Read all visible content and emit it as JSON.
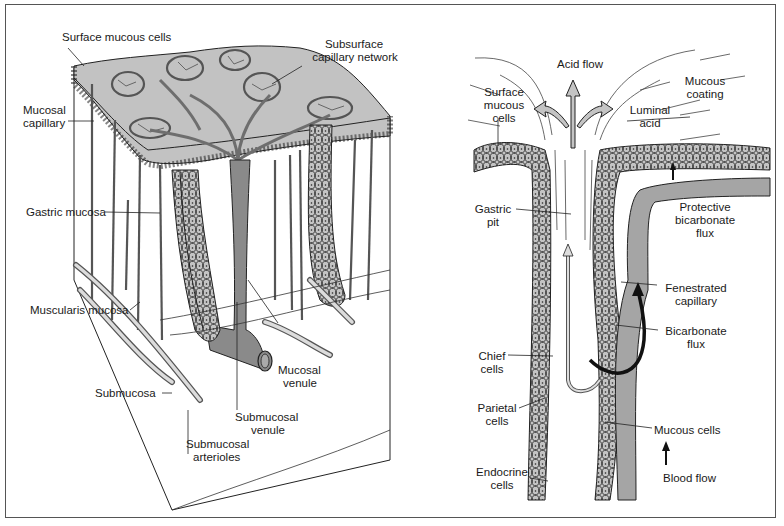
{
  "figure": {
    "panels": [
      {
        "id": "left",
        "description": "3D block of gastric mucosa showing vasculature",
        "labels": {
          "surface_mucous_cells": "Surface mucous cells",
          "subsurface_capillary_network_1": "Subsurface",
          "subsurface_capillary_network_2": "capillary network",
          "mucosal_capillary_1": "Mucosal",
          "mucosal_capillary_2": "capillary",
          "gastric_mucosa": "Gastric mucosa",
          "muscularis_mucosa": "Muscularis mucosa",
          "submucosa": "Submucosa",
          "mucosal_venule_1": "Mucosal",
          "mucosal_venule_2": "venule",
          "submucosal_venule_1": "Submucosal",
          "submucosal_venule_2": "venule",
          "submucosal_arterioles_1": "Submucosal",
          "submucosal_arterioles_2": "arterioles"
        }
      },
      {
        "id": "right",
        "description": "Gastric pit cross-section showing acid and bicarbonate flux",
        "labels": {
          "acid_flow": "Acid flow",
          "surface_mucous_cells_1": "Surface",
          "surface_mucous_cells_2": "mucous",
          "surface_mucous_cells_3": "cells",
          "mucous_coating_1": "Mucous",
          "mucous_coating_2": "coating",
          "luminal_acid_1": "Luminal",
          "luminal_acid_2": "acid",
          "gastric_pit_1": "Gastric",
          "gastric_pit_2": "pit",
          "protective_bicarbonate_flux_1": "Protective",
          "protective_bicarbonate_flux_2": "bicarbonate",
          "protective_bicarbonate_flux_3": "flux",
          "fenestrated_capillary_1": "Fenestrated",
          "fenestrated_capillary_2": "capillary",
          "bicarbonate_flux_1": "Bicarbonate",
          "bicarbonate_flux_2": "flux",
          "chief_cells_1": "Chief",
          "chief_cells_2": "cells",
          "parietal_cells_1": "Parietal",
          "parietal_cells_2": "cells",
          "mucous_cells": "Mucous cells",
          "endocrine_cells_1": "Endocrine",
          "endocrine_cells_2": "cells",
          "blood_flow": "Blood flow"
        }
      }
    ],
    "colors": {
      "tissue_gray": "#c4c4c4",
      "vessel_gray": "#8a8a8a",
      "ink": "#1a1a1a",
      "border": "#555555"
    }
  }
}
